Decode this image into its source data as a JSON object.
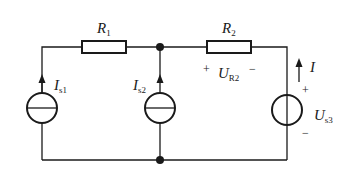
{
  "diagram": {
    "type": "electric-circuit",
    "components": {
      "R1": {
        "label": "R",
        "sub": "1"
      },
      "R2": {
        "label": "R",
        "sub": "2"
      },
      "Is1": {
        "label": "I",
        "sub": "s1"
      },
      "Is2": {
        "label": "I",
        "sub": "s2"
      },
      "Us3": {
        "label": "U",
        "sub": "s3",
        "plus": "+",
        "minus": "−"
      },
      "UR2": {
        "label": "U",
        "sub": "R2",
        "plus": "+",
        "minus": "−"
      },
      "I": {
        "label": "I"
      }
    },
    "colors": {
      "line": "#1a1a1a",
      "background": "#ffffff"
    }
  }
}
